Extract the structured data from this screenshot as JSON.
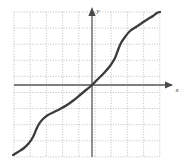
{
  "figure": {
    "name": "coordinate-graph",
    "background_color": "#ffffff",
    "width": 185,
    "height": 167
  },
  "grid": {
    "color": "#b9b9bd",
    "style": "dotted",
    "left": 14,
    "right": 160,
    "top": 12,
    "bottom": 157,
    "step_x": 16.2,
    "step_y": 16.1,
    "columns": 10,
    "rows": 10,
    "show": true
  },
  "axes": {
    "color": "#555558",
    "origin_x": 92,
    "origin_y": 85,
    "x_axis": {
      "label": "x",
      "label_x": 177,
      "label_y": 91,
      "start_x": 14,
      "end_x": 174,
      "arrow": "right"
    },
    "y_axis": {
      "label": "y",
      "label_x": 97,
      "label_y": 12,
      "start_y": 157,
      "end_y": 8,
      "arrow": "up"
    }
  },
  "chart_data": {
    "type": "line",
    "title": "",
    "xlabel": "x",
    "ylabel": "y",
    "grid": true,
    "legend": "none",
    "xlim": [
      -4.8,
      4.2
    ],
    "ylim": [
      -4.5,
      4.5
    ],
    "curve_color": "#3c3c3c",
    "curve_width": 2.3,
    "series": [
      {
        "name": "curve",
        "points_px": [
          [
            13,
            155
          ],
          [
            18,
            152
          ],
          [
            24,
            148
          ],
          [
            29,
            143
          ],
          [
            33,
            137
          ],
          [
            36,
            130
          ],
          [
            39,
            124
          ],
          [
            43,
            119
          ],
          [
            48,
            115
          ],
          [
            54,
            112
          ],
          [
            60,
            109
          ],
          [
            67,
            105
          ],
          [
            74,
            100
          ],
          [
            80,
            95
          ],
          [
            86,
            90
          ],
          [
            92,
            85
          ],
          [
            98,
            79
          ],
          [
            104,
            73
          ],
          [
            110,
            66
          ],
          [
            115,
            58
          ],
          [
            118,
            50
          ],
          [
            121,
            43
          ],
          [
            125,
            37
          ],
          [
            130,
            31
          ],
          [
            136,
            27
          ],
          [
            142,
            23
          ],
          [
            148,
            19
          ],
          [
            153,
            16
          ],
          [
            157,
            13
          ],
          [
            160,
            12
          ]
        ],
        "points_data": [
          [
            -4.85,
            -4.35
          ],
          [
            -4.2,
            -3.8
          ],
          [
            -3.6,
            -3.1
          ],
          [
            -3.0,
            -2.5
          ],
          [
            -2.5,
            -1.9
          ],
          [
            -2.0,
            -1.45
          ],
          [
            -1.5,
            -1.2
          ],
          [
            -1.0,
            -0.95
          ],
          [
            -0.5,
            -0.5
          ],
          [
            0.0,
            0.0
          ],
          [
            0.5,
            0.5
          ],
          [
            1.0,
            0.95
          ],
          [
            1.5,
            1.5
          ],
          [
            1.8,
            2.3
          ],
          [
            2.1,
            3.0
          ],
          [
            2.6,
            3.4
          ],
          [
            3.2,
            3.7
          ],
          [
            3.9,
            4.0
          ],
          [
            4.2,
            4.15
          ]
        ]
      }
    ]
  }
}
